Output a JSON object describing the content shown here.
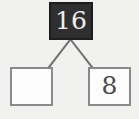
{
  "diagram": {
    "type": "number-bond",
    "background_color": "#f1f1f0",
    "parent": {
      "value": "16",
      "fill_color": "#2f2f2f",
      "text_color": "#efefef",
      "border_color": "#1d1d1d"
    },
    "children": [
      {
        "position": "left",
        "value": "",
        "state": "empty",
        "fill_color": "#fdfdfd",
        "text_color": "#4a4a4a",
        "border_color": "#8a8a8a"
      },
      {
        "position": "right",
        "value": "8",
        "state": "filled",
        "fill_color": "#fdfdfd",
        "text_color": "#4a4a4a",
        "border_color": "#8a8a8a"
      }
    ],
    "connectors": {
      "color": "#6e6e6e",
      "width": 2,
      "links": [
        {
          "from": "parent",
          "to": "left-child"
        },
        {
          "from": "parent",
          "to": "right-child"
        }
      ]
    }
  }
}
